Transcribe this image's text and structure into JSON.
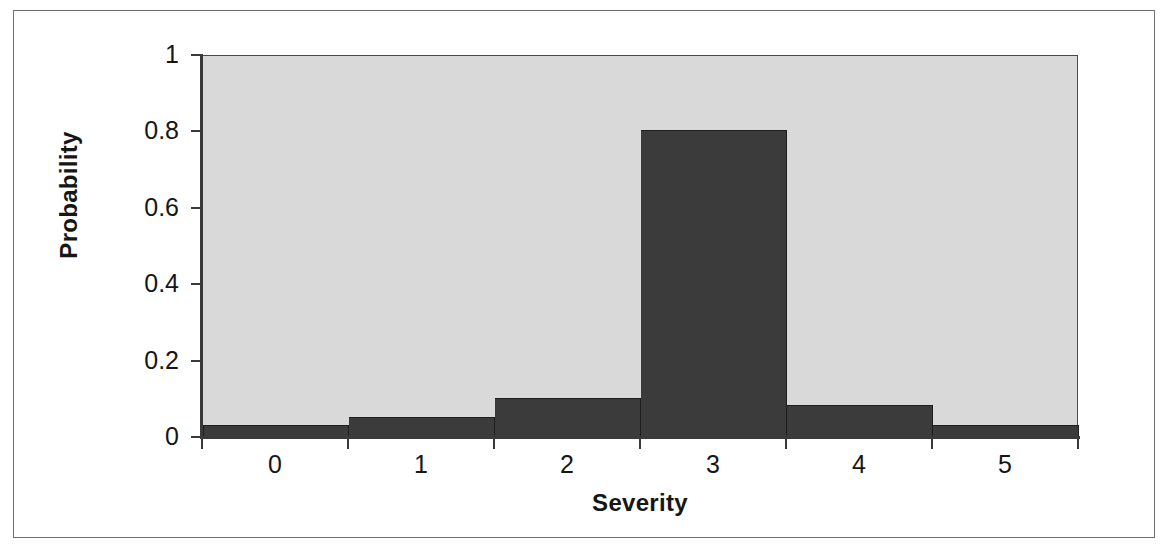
{
  "chart_data": {
    "type": "bar",
    "title": "",
    "subtitle": "",
    "xlabel": "Severity",
    "ylabel": "Probability",
    "categories": [
      "0",
      "1",
      "2",
      "3",
      "4",
      "5"
    ],
    "values": [
      0.03,
      0.05,
      0.1,
      0.8,
      0.08,
      0.03
    ],
    "series": [
      {
        "name": "Probability",
        "values": [
          0.03,
          0.05,
          0.1,
          0.8,
          0.08,
          0.03
        ]
      }
    ],
    "xlim": [
      -0.5,
      5.5
    ],
    "ylim": [
      0,
      1
    ],
    "ytick_labels": [
      "0",
      "0.2",
      "0.4",
      "0.6",
      "0.8",
      "1"
    ],
    "ytick_values": [
      0,
      0.2,
      0.4,
      0.6,
      0.8,
      1
    ],
    "xtick_labels": [
      "0",
      "1",
      "2",
      "3",
      "4",
      "5"
    ],
    "grid": false,
    "legend": false,
    "legend_position": "none",
    "bar_gap": 0,
    "colors": {
      "bar_fill": "#3b3b3b",
      "bar_edge": "#1e1e1e",
      "plot_background": "#d9d9d9",
      "figure_background": "#ffffff",
      "axis_line": "#3a3a3a",
      "frame_border": "#6e6e6e",
      "text": "#161616"
    }
  }
}
